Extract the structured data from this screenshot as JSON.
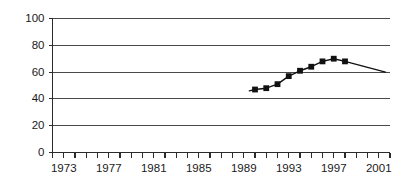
{
  "chart_data": {
    "type": "line",
    "title": "",
    "subtitle": "",
    "xlabel": "",
    "ylabel": "",
    "xlim": [
      1972,
      2002
    ],
    "ylim": [
      0,
      100
    ],
    "grid": true,
    "legend": false,
    "legend_position": "none",
    "y_ticks": [
      0,
      20,
      40,
      60,
      80,
      100
    ],
    "y_tick_labels": [
      "0",
      "20",
      "40",
      "60",
      "80",
      "100"
    ],
    "x_tick_labels": [
      "1973",
      "1977",
      "1981",
      "1985",
      "1989",
      "1993",
      "1997",
      "2001"
    ],
    "x_tick_label_years": [
      1973,
      1977,
      1981,
      1985,
      1989,
      1993,
      1997,
      2001
    ],
    "x_minor_tick_years": [
      1972,
      1973,
      1974,
      1975,
      1976,
      1977,
      1978,
      1979,
      1980,
      1981,
      1982,
      1983,
      1984,
      1985,
      1986,
      1987,
      1988,
      1989,
      1990,
      1991,
      1992,
      1993,
      1994,
      1995,
      1996,
      1997,
      1998,
      1999,
      2000,
      2001,
      2002
    ],
    "series": [
      {
        "name": "series-1",
        "color": "#111111",
        "marker": "square",
        "x": [
          1990,
          1991,
          1992,
          1993,
          1994,
          1995,
          1996,
          1997,
          1998
        ],
        "values": [
          47,
          48,
          51,
          57,
          61,
          64,
          68,
          70,
          68
        ],
        "lead_in": {
          "x": 1989.5,
          "value": 46
        },
        "trail_off": {
          "x": 2001.6,
          "value": 60
        }
      }
    ],
    "colors": {
      "line": "#111111",
      "marker": "#111111",
      "grid": "#4a4a4a",
      "axis": "#2b2b2b",
      "text": "#1a1a1a",
      "background": "#ffffff"
    }
  }
}
